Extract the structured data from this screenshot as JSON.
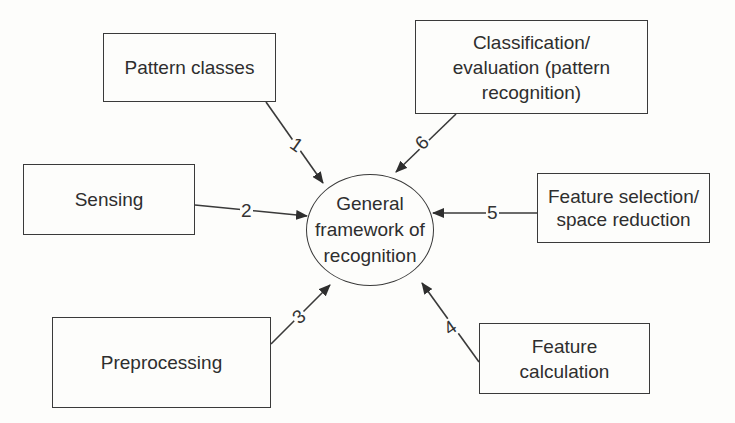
{
  "diagram": {
    "type": "hub-and-spoke",
    "center": {
      "label": "General framework of recognition",
      "lines": [
        "General",
        "framework of",
        "recognition"
      ]
    },
    "nodes": [
      {
        "id": "pattern-classes",
        "label": "Pattern classes",
        "edge_number": "1"
      },
      {
        "id": "sensing",
        "label": "Sensing",
        "edge_number": "2"
      },
      {
        "id": "preprocessing",
        "label": "Preprocessing",
        "edge_number": "3"
      },
      {
        "id": "feature-calculation",
        "label": "Feature calculation",
        "edge_number": "4"
      },
      {
        "id": "feature-selection",
        "label": "Feature selection/ space reduction",
        "edge_number": "5"
      },
      {
        "id": "classification",
        "label": "Classification/ evaluation (pattern recognition)",
        "edge_number": "6"
      }
    ],
    "edges_direction": "node-to-center",
    "colors": {
      "line": "#3a3a3a",
      "background": "#fdfdfb",
      "text": "#2e2e2e"
    }
  }
}
